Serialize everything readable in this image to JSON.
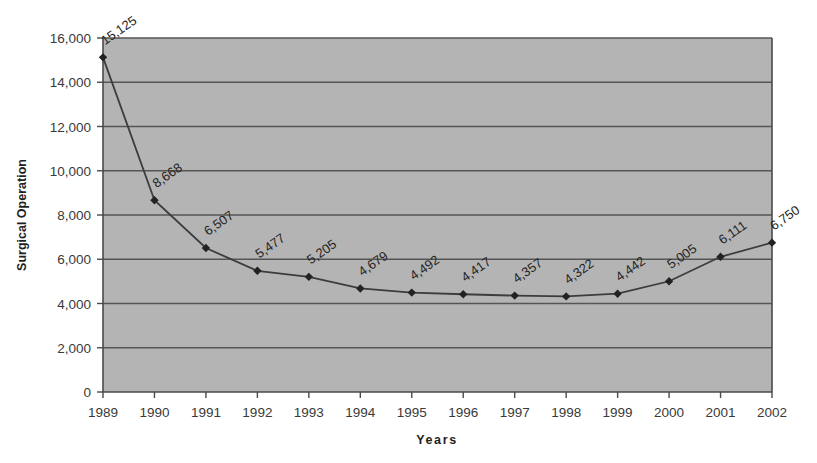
{
  "chart_data": {
    "type": "line",
    "title": "",
    "xlabel": "Years",
    "ylabel": "Surgical Operation",
    "categories": [
      "1989",
      "1990",
      "1991",
      "1992",
      "1993",
      "1994",
      "1995",
      "1996",
      "1997",
      "1998",
      "1999",
      "2000",
      "2001",
      "2002"
    ],
    "values": [
      15125,
      8668,
      6507,
      5477,
      5205,
      4679,
      4492,
      4417,
      4357,
      4322,
      4442,
      5005,
      6111,
      6750
    ],
    "point_labels": [
      "15,125",
      "8,668",
      "6,507",
      "5,477",
      "5,205",
      "4,679",
      "4,492",
      "4,417",
      "4,357",
      "4,322",
      "4,442",
      "5,005",
      "6,111",
      "6,750"
    ],
    "ylim": [
      0,
      16000
    ],
    "ytick_values": [
      0,
      2000,
      4000,
      6000,
      8000,
      10000,
      12000,
      14000,
      16000
    ],
    "ytick_labels": [
      "0",
      "2,000",
      "4,000",
      "6,000",
      "8,000",
      "10,000",
      "12,000",
      "14,000",
      "16,000"
    ],
    "grid": true,
    "grid_axis": "y",
    "legend": false,
    "legend_position": "none",
    "marker": "diamond",
    "data_label_rotation": -35,
    "colors": {
      "plot_background": "#b4b4b4",
      "page_background": "#ffffff",
      "line": "#3c3c3c",
      "marker": "#222222",
      "gridline": "#5a5a5a",
      "axis": "#4a4a4a",
      "text": "#2b2b2b"
    }
  }
}
